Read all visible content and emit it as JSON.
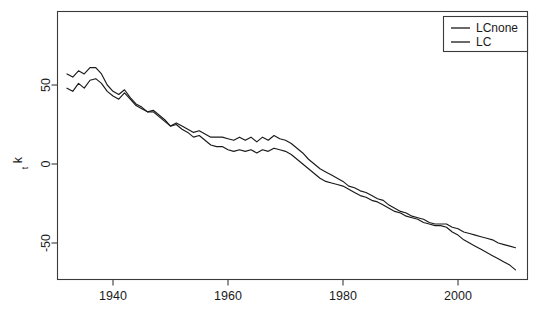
{
  "chart_data": {
    "type": "line",
    "title": "",
    "xlabel": "",
    "ylabel": "kt",
    "ylabel_base": "k",
    "ylabel_sub": "t",
    "xlim": [
      1931,
      2011
    ],
    "ylim": [
      -80,
      85
    ],
    "grid": false,
    "legend_position": "top-right",
    "xticks": [
      1940,
      1960,
      1980,
      2000
    ],
    "xtick_labels": [
      "1940",
      "1960",
      "1980",
      "2000"
    ],
    "yticks": [
      50,
      0,
      -50
    ],
    "ytick_labels": [
      "50",
      "0",
      "-50"
    ],
    "x": [
      1932,
      1933,
      1934,
      1935,
      1936,
      1937,
      1938,
      1939,
      1940,
      1941,
      1942,
      1943,
      1944,
      1945,
      1946,
      1947,
      1948,
      1949,
      1950,
      1951,
      1952,
      1953,
      1954,
      1955,
      1956,
      1957,
      1958,
      1959,
      1960,
      1961,
      1962,
      1963,
      1964,
      1965,
      1966,
      1967,
      1968,
      1969,
      1970,
      1971,
      1972,
      1973,
      1974,
      1975,
      1976,
      1977,
      1978,
      1979,
      1980,
      1981,
      1982,
      1983,
      1984,
      1985,
      1986,
      1987,
      1988,
      1989,
      1990,
      1991,
      1992,
      1993,
      1994,
      1995,
      1996,
      1997,
      1998,
      1999,
      2000,
      2001,
      2002,
      2003,
      2004,
      2005,
      2006,
      2007,
      2008,
      2009,
      2010
    ],
    "series": [
      {
        "name": "LCnone",
        "color": "#1a1a1a",
        "values": [
          57,
          55,
          59,
          57,
          61,
          61,
          57,
          50,
          46,
          44,
          47,
          42,
          38,
          36,
          33,
          33,
          30,
          27,
          24,
          26,
          24,
          22,
          20,
          21,
          19,
          17,
          17,
          17,
          16,
          15,
          17,
          15,
          17,
          14,
          17,
          15,
          18,
          16,
          15,
          13,
          10,
          7,
          3,
          0,
          -3,
          -5,
          -7,
          -9,
          -11,
          -14,
          -15,
          -17,
          -18,
          -20,
          -22,
          -23,
          -26,
          -28,
          -30,
          -31,
          -33,
          -34,
          -35,
          -37,
          -38,
          -38,
          -38,
          -40,
          -41,
          -43,
          -44,
          -45,
          -46,
          -47,
          -48,
          -50,
          -51,
          -52,
          -53
        ]
      },
      {
        "name": "LC",
        "color": "#1a1a1a",
        "values": [
          48,
          46,
          51,
          48,
          53,
          54,
          51,
          46,
          43,
          41,
          45,
          41,
          37,
          35,
          33,
          34,
          31,
          28,
          24,
          25,
          22,
          20,
          17,
          18,
          15,
          12,
          11,
          11,
          9,
          8,
          9,
          8,
          9,
          7,
          9,
          8,
          10,
          9,
          8,
          6,
          3,
          0,
          -3,
          -6,
          -9,
          -11,
          -12,
          -13,
          -14,
          -16,
          -18,
          -20,
          -21,
          -23,
          -24,
          -26,
          -28,
          -30,
          -31,
          -33,
          -34,
          -35,
          -37,
          -38,
          -39,
          -39,
          -40,
          -43,
          -45,
          -48,
          -50,
          -52,
          -54,
          -56,
          -58,
          -60,
          -62,
          -64,
          -67
        ]
      }
    ]
  },
  "legend": {
    "items": [
      {
        "label": "LCnone"
      },
      {
        "label": "LC"
      }
    ]
  }
}
